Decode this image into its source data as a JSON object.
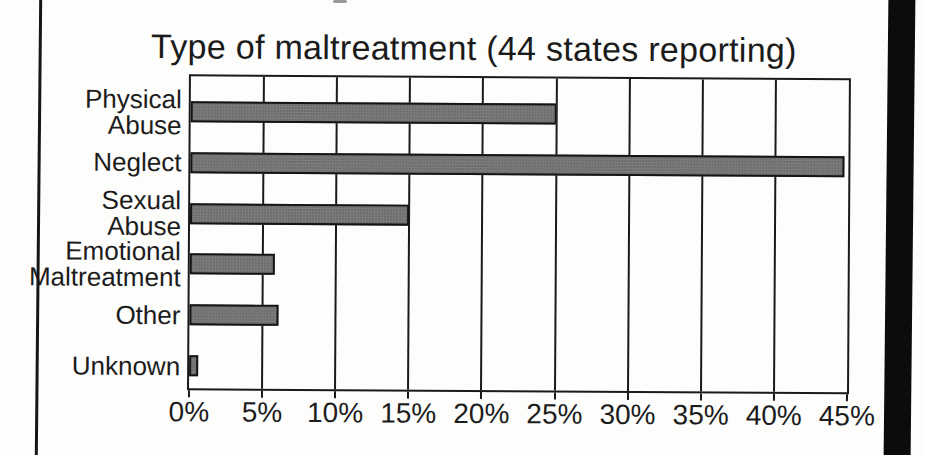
{
  "page": {
    "background": "#fdfdfc",
    "scan_left_rule_color": "#161616",
    "scan_right_band_color": "#0c0c0c"
  },
  "chart_data": {
    "type": "bar",
    "orientation": "horizontal",
    "title": "Type of maltreatment (44 states reporting)",
    "categories": [
      "Physical Abuse",
      "Neglect",
      "Sexual Abuse",
      "Emotional Maltreatment",
      "Other",
      "Unknown"
    ],
    "category_label_lines": [
      [
        "Physical",
        "Abuse"
      ],
      [
        "Neglect"
      ],
      [
        "Sexual",
        "Abuse"
      ],
      [
        "Emotional",
        "Maltreatment"
      ],
      [
        "Other"
      ],
      [
        "Unknown"
      ]
    ],
    "values": [
      25,
      44.7,
      15,
      5.8,
      6.1,
      0.6
    ],
    "unit": "%",
    "xlabel": "",
    "ylabel": "",
    "xlim": [
      0,
      45
    ],
    "x_ticks": [
      {
        "value": 0,
        "label": "0%"
      },
      {
        "value": 5,
        "label": "5%"
      },
      {
        "value": 10,
        "label": "10%"
      },
      {
        "value": 15,
        "label": "15%"
      },
      {
        "value": 20,
        "label": "20%"
      },
      {
        "value": 25,
        "label": "25%"
      },
      {
        "value": 30,
        "label": "30%"
      },
      {
        "value": 35,
        "label": "35%"
      },
      {
        "value": 40,
        "label": "40%"
      },
      {
        "value": 45,
        "label": "45%"
      }
    ],
    "grid": "vertical gridlines at every 5% tick",
    "legend": "none",
    "bar_fill": "#7d7d7d",
    "bar_border": "#141414",
    "axis_color": "#1a1a1a",
    "text_color": "#1c1c1c"
  }
}
